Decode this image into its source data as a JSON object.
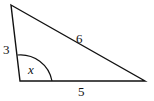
{
  "diagram": {
    "type": "triangle",
    "sides": [
      {
        "id": "left",
        "label": "3"
      },
      {
        "id": "hypotenuse",
        "label": "6"
      },
      {
        "id": "bottom",
        "label": "5"
      }
    ],
    "angle": {
      "label": "x",
      "vertex": "bottom-left"
    },
    "colors": {
      "stroke": "#111111",
      "background": "#ffffff"
    }
  }
}
